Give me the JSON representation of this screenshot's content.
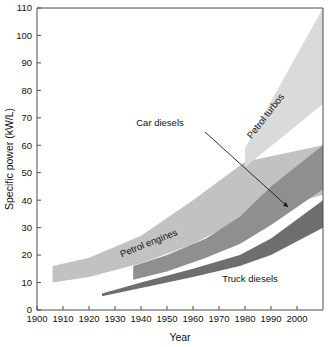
{
  "chart_data": {
    "type": "area",
    "title": "",
    "xlabel": "Year",
    "ylabel": "Specific power (kW/L)",
    "xlim": [
      1900,
      2010
    ],
    "ylim": [
      0,
      110
    ],
    "grid": false,
    "legend_position": "inline-labels",
    "x_ticks": [
      1900,
      1910,
      1920,
      1930,
      1940,
      1950,
      1960,
      1970,
      1980,
      1990,
      2000
    ],
    "x_tick_labels": [
      "1900",
      "1910",
      "1920",
      "1930",
      "1940",
      "1950",
      "1960",
      "1970",
      "1980",
      "1990",
      "2000"
    ],
    "y_ticks": [
      0,
      10,
      20,
      30,
      40,
      50,
      60,
      70,
      80,
      90,
      100,
      110
    ],
    "y_tick_labels": [
      "0",
      "10",
      "20",
      "30",
      "40",
      "50",
      "60",
      "70",
      "80",
      "90",
      "100",
      "110"
    ],
    "series": [
      {
        "name": "Petrol engines",
        "label": "Petrol engines",
        "color": "#c2c2c2",
        "label_rotation": -22,
        "label_x": 150,
        "label_y": 246,
        "x": [
          1906,
          1920,
          1940,
          1960,
          1980,
          2010
        ],
        "upper": [
          16,
          19,
          27,
          40,
          54,
          60
        ],
        "lower": [
          10,
          12,
          17,
          24,
          34,
          42
        ]
      },
      {
        "name": "Petrol turbos",
        "label": "Petrol turbos",
        "color": "#dadada",
        "label_rotation": -52,
        "label_x": 268,
        "label_y": 118,
        "x": [
          1980,
          2010
        ],
        "upper": [
          59,
          110
        ],
        "lower": [
          52,
          75
        ]
      },
      {
        "name": "Car diesels",
        "label": "Car diesels",
        "color": "#8f8f8f",
        "label_rotation": 0,
        "label_x": 160,
        "label_y": 126,
        "arrow_from_x": 205,
        "arrow_from_y": 132,
        "arrow_to_x": 288,
        "arrow_to_y": 207,
        "x": [
          1937,
          1950,
          1965,
          1978,
          1990,
          2010
        ],
        "upper": [
          16,
          20,
          26,
          34,
          45,
          60
        ],
        "lower": [
          11,
          14,
          19,
          24,
          31,
          44
        ]
      },
      {
        "name": "Truck diesels",
        "label": "Truck diesels",
        "color": "#6e6e6e",
        "label_rotation": 0,
        "label_x": 250,
        "label_y": 282,
        "x": [
          1925,
          1940,
          1960,
          1978,
          1990,
          2010
        ],
        "upper": [
          6,
          10,
          15,
          20,
          26,
          40
        ],
        "lower": [
          5,
          8,
          12,
          16,
          20,
          30
        ]
      }
    ]
  },
  "axes": {
    "x_title": "Year",
    "y_title": "Specific power (kW/L)"
  }
}
